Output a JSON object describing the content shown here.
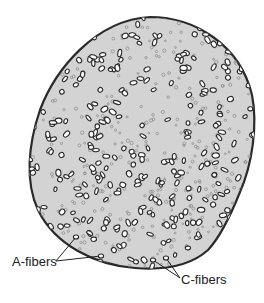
{
  "diagram": {
    "colors": {
      "background": "#ffffff",
      "nerve_fill": "#d3d3d3",
      "outline": "#2a2a2a",
      "a_fiber_fill": "#ffffff",
      "a_fiber_stroke": "#2b2b2b",
      "c_fiber_stroke": "#8a8a8a",
      "label_text": "#222222"
    },
    "labels": [
      {
        "text": "A-fibers",
        "x": 12,
        "y": 254
      },
      {
        "text": "C-fibers",
        "x": 181,
        "y": 272
      }
    ],
    "leaders": {
      "a_fibers": {
        "from": [
          56,
          261
        ],
        "to": [
          [
            76,
            237
          ],
          [
            101,
            256
          ]
        ]
      },
      "c_fibers": {
        "from": [
          180,
          278
        ],
        "to": [
          [
            153,
            260
          ],
          [
            166,
            258
          ]
        ]
      }
    },
    "outline_path": "M150,17 C195,17 240,45 252,95 C258,125 252,165 240,192 C232,212 222,235 208,250 C188,268 160,270 135,268 C95,265 55,245 38,210 C25,182 28,145 40,110 C55,70 95,20 150,17 Z",
    "fiber_density": {
      "a_fiber_count": 340,
      "c_fiber_count": 420,
      "seed": 7
    }
  }
}
